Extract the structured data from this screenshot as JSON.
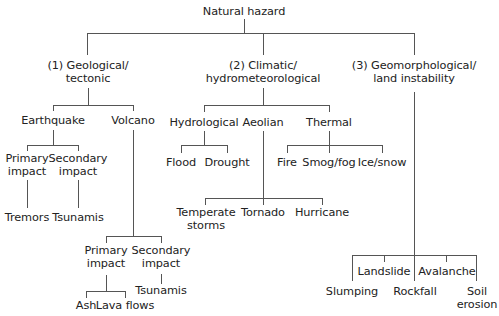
{
  "diagram": {
    "title": "Natural hazard",
    "branches": [
      {
        "label_line1": "(1) Geological/",
        "label_line2": "tectonic",
        "children": [
          {
            "label": "Earthquake",
            "children": [
              {
                "label_line1": "Primary",
                "label_line2": "impact",
                "children": [
                  {
                    "label": "Tremors"
                  }
                ]
              },
              {
                "label_line1": "Secondary",
                "label_line2": "impact",
                "children": [
                  {
                    "label": "Tsunamis"
                  }
                ]
              }
            ]
          },
          {
            "label": "Volcano",
            "children": [
              {
                "label_line1": "Primary",
                "label_line2": "impact",
                "children": [
                  {
                    "label": "Ash"
                  },
                  {
                    "label": "Lava flows"
                  }
                ]
              },
              {
                "label_line1": "Secondary",
                "label_line2": "impact",
                "children": [
                  {
                    "label": "Tsunamis"
                  }
                ]
              }
            ]
          }
        ]
      },
      {
        "label_line1": "(2) Climatic/",
        "label_line2": "hydrometeorological",
        "children": [
          {
            "label": "Hydrological",
            "children": [
              {
                "label": "Flood"
              },
              {
                "label": "Drought"
              }
            ]
          },
          {
            "label": "Aeolian",
            "children": [
              {
                "label_line1": "Temperate",
                "label_line2": "storms"
              },
              {
                "label": "Tornado"
              },
              {
                "label": "Hurricane"
              }
            ]
          },
          {
            "label": "Thermal",
            "children": [
              {
                "label": "Fire"
              },
              {
                "label": "Smog/fog"
              },
              {
                "label": "Ice/snow"
              }
            ]
          }
        ]
      },
      {
        "label_line1": "(3) Geomorphological/",
        "label_line2": "land instability",
        "children": [
          {
            "label": "Slumping"
          },
          {
            "label": "Landslide"
          },
          {
            "label": "Rockfall"
          },
          {
            "label": "Avalanche"
          },
          {
            "label_line1": "Soil",
            "label_line2": "erosion"
          }
        ]
      }
    ]
  }
}
